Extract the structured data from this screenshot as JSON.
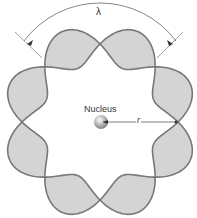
{
  "diagram": {
    "wavelength_label": "λ",
    "nucleus_label": "Nucleus",
    "radius_label": "r",
    "lobes": 8,
    "colors": {
      "wave_stroke": "#777777",
      "wave_fill": "#d4d4d4",
      "nucleus": "#aaaaaa"
    }
  }
}
